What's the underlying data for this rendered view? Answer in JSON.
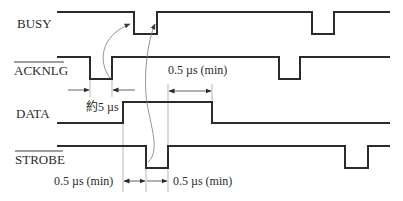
{
  "diagram": {
    "type": "timing-diagram",
    "signals": [
      {
        "name": "BUSY",
        "overline": false,
        "label_y": 28,
        "high_y": 12,
        "low_y": 34,
        "edges": [
          57,
          134,
          157,
          312,
          334,
          390
        ],
        "start_level": "high"
      },
      {
        "name": "ACKNLG",
        "overline": true,
        "label_y": 75,
        "high_y": 57,
        "low_y": 79,
        "edges": [
          57,
          90,
          112,
          279,
          300,
          390
        ],
        "start_level": "high"
      },
      {
        "name": "DATA",
        "overline": false,
        "label_y": 118,
        "high_y": 102,
        "low_y": 123,
        "edges": [
          57,
          123,
          212,
          390
        ],
        "start_level": "low"
      },
      {
        "name": "STROBE",
        "overline": true,
        "label_y": 164,
        "high_y": 146,
        "low_y": 168,
        "edges": [
          57,
          146,
          168,
          345,
          368,
          390
        ],
        "start_level": "high"
      }
    ],
    "annotations": {
      "ack_pulse": "約5 µs",
      "data_hold": "0.5 µs (min)",
      "strobe_setup": "0.5 µs (min)",
      "strobe_hold": "0.5 µs (min)"
    },
    "colors": {
      "waveform": "#2b2b2b",
      "guide": "#9a9a9a",
      "text": "#2a2a2a"
    }
  }
}
